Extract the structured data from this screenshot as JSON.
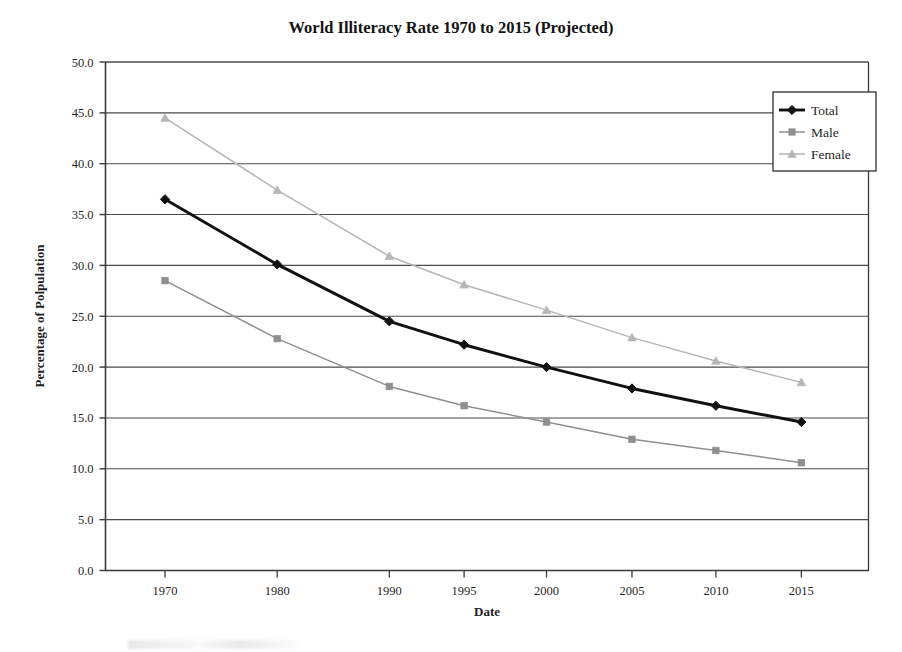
{
  "chart_data": {
    "type": "line",
    "title": "World Illiteracy Rate 1970 to 2015 (Projected)",
    "xlabel": "Date",
    "ylabel": "Percentage of Polpulation",
    "categories": [
      "1970",
      "1980",
      "1990",
      "1995",
      "2000",
      "2005",
      "2010",
      "2015"
    ],
    "ylim": [
      0.0,
      50.0
    ],
    "ytick_step": 5.0,
    "ytick_labels": [
      "0.0",
      "5.0",
      "10.0",
      "15.0",
      "20.0",
      "25.0",
      "30.0",
      "35.0",
      "40.0",
      "45.0",
      "50.0"
    ],
    "grid": "horizontal",
    "legend_position": "top-right",
    "series": [
      {
        "name": "Total",
        "color": "#111111",
        "marker": "diamond",
        "values": [
          36.5,
          30.1,
          24.5,
          22.2,
          20.0,
          17.9,
          16.2,
          14.6
        ]
      },
      {
        "name": "Male",
        "color": "#8f8f8f",
        "marker": "square",
        "values": [
          28.5,
          22.8,
          18.1,
          16.2,
          14.6,
          12.9,
          11.8,
          10.6
        ]
      },
      {
        "name": "Female",
        "color": "#b6b6b6",
        "marker": "triangle",
        "values": [
          44.5,
          37.4,
          30.9,
          28.1,
          25.6,
          22.9,
          20.6,
          18.5
        ]
      }
    ]
  },
  "colors": {
    "axis": "#3a3a3a",
    "gridline": "#4a4a4a",
    "background": "#ffffff",
    "total": "#111111",
    "male": "#8f8f8f",
    "female": "#b6b6b6"
  }
}
